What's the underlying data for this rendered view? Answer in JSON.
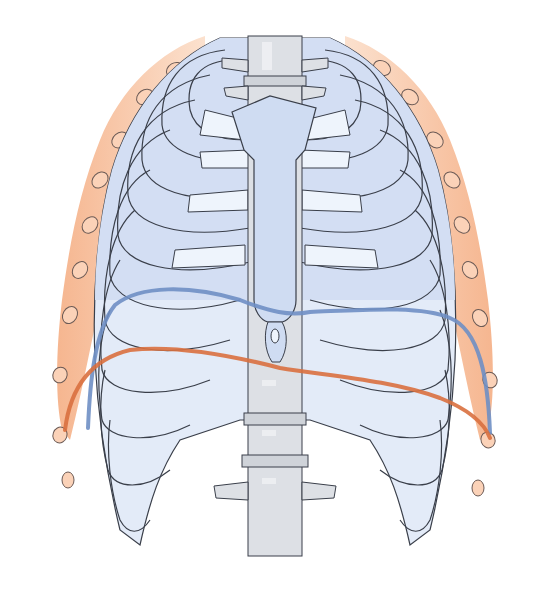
{
  "figure": {
    "colors": {
      "background": "#ffffff",
      "bone_fill": "#d6e1f5",
      "bone_light": "#eef3fb",
      "cartilage_fill": "#e8f0fb",
      "spine_fill": "#dcdfe3",
      "spine_light": "#eceef0",
      "outline": "#3a3f4a",
      "muscle_fill": "#f4b088",
      "muscle_light": "#fbd9c2",
      "diaphragm_exhale": "#6f8fc4",
      "diaphragm_inhale": "#d9703f"
    },
    "lines": [
      {
        "name": "diaphragm-expiration-line",
        "color": "#6f8fc4"
      },
      {
        "name": "diaphragm-inspiration-line",
        "color": "#d9703f"
      }
    ]
  }
}
